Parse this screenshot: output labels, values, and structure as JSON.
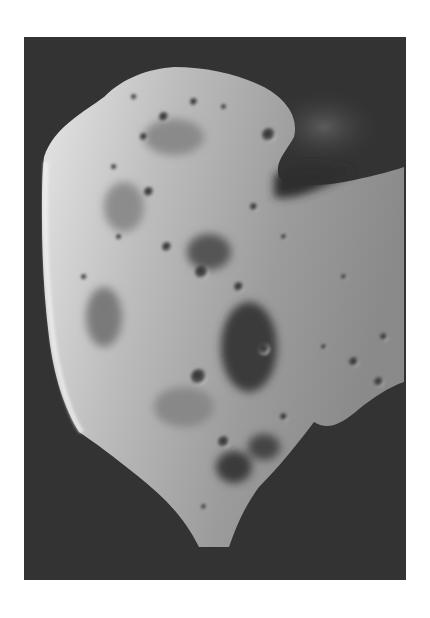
{
  "image": {
    "subject": "asteroid",
    "alt": "Grayscale photograph of a cratered asteroid against dark space",
    "colors": {
      "page_background": "#ffffff",
      "space_background": "#333333",
      "surface_light": "#d9d9d9",
      "surface_mid": "#9a9a9a",
      "surface_shadow": "#3a3a3a"
    }
  }
}
